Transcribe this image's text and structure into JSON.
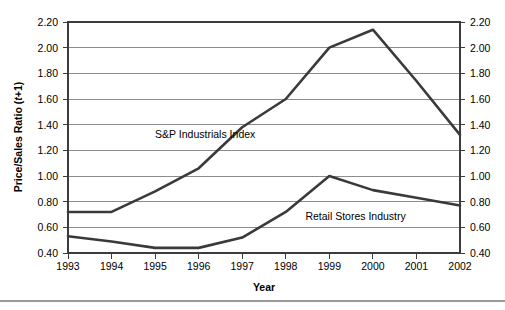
{
  "chart_data": {
    "type": "line",
    "title": "",
    "subtitle": "",
    "xlabel": "Year",
    "ylabel": "Price/Sales Ratio (t+1)",
    "ylabel_prefix": "Price/Sales Ratio (",
    "ylabel_italic": "t",
    "ylabel_suffix": "+1)",
    "right_ylabel": "",
    "categories": [
      "1993",
      "1994",
      "1995",
      "1996",
      "1997",
      "1998",
      "1999",
      "2000",
      "2001",
      "2002"
    ],
    "x": [
      1993,
      1994,
      1995,
      1996,
      1997,
      1998,
      1999,
      2000,
      2001,
      2002
    ],
    "ylim": [
      0.4,
      2.2
    ],
    "ytick_values": [
      0.4,
      0.6,
      0.8,
      1.0,
      1.2,
      1.4,
      1.6,
      1.8,
      2.0,
      2.2
    ],
    "ytick_labels": [
      "0.40",
      "0.60",
      "0.80",
      "1.00",
      "1.20",
      "1.40",
      "1.60",
      "1.80",
      "2.00",
      "2.20"
    ],
    "right_ytick_labels": [
      "0.40",
      "0.60",
      "0.80",
      "1.00",
      "1.20",
      "1.40",
      "1.60",
      "1.80",
      "2.00",
      "2.20"
    ],
    "grid": true,
    "grid_axis": "y",
    "legend": "inline-annotations",
    "series": [
      {
        "name": "S&P Industrials Index",
        "values": [
          0.72,
          0.72,
          0.88,
          1.06,
          1.38,
          1.6,
          2.0,
          2.14,
          1.74,
          1.32
        ],
        "color": "#3a3a3a"
      },
      {
        "name": "Retail Stores Industry",
        "values": [
          0.53,
          0.49,
          0.44,
          0.44,
          0.52,
          0.72,
          1.0,
          0.89,
          0.83,
          0.77
        ],
        "color": "#3a3a3a"
      }
    ],
    "annotations": [
      {
        "text": "S&P Industrials Index",
        "x": 1995.0,
        "y": 1.33
      },
      {
        "text": "Retail Stores Industry",
        "x": 1998.45,
        "y": 0.69
      }
    ]
  }
}
